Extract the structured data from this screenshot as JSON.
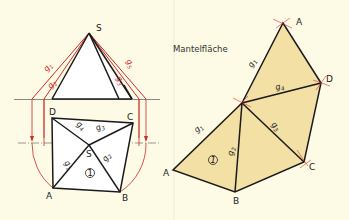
{
  "title": "Mantelfläche",
  "colors": {
    "background": "#fdfbe6",
    "fill_development": "#f3e0a5",
    "fill_plan": "#ffffff",
    "construction_red": "#cc2a2a",
    "line_black": "#1a1a1a",
    "separator": "#e8e4cc"
  },
  "elevation": {
    "apex_label": "S",
    "edge_labels": [
      "g1",
      "g2",
      "g3",
      "g5"
    ]
  },
  "plan_view": {
    "vertices": [
      "A",
      "B",
      "C",
      "D",
      "S"
    ],
    "edge_labels": [
      "g1",
      "g2",
      "g3",
      "g4"
    ],
    "face_number": "1"
  },
  "development": {
    "vertices": [
      "A",
      "D",
      "C",
      "A",
      "B"
    ],
    "edge_labels": [
      "g1",
      "g4",
      "g3",
      "g1",
      "g2"
    ],
    "face_number": "1"
  },
  "labels": {
    "S": "S",
    "A": "A",
    "B": "B",
    "C": "C",
    "D": "D",
    "g1": "g",
    "g2": "g",
    "g3": "g",
    "g4": "g",
    "g5": "g",
    "sub1": "1",
    "sub2": "2",
    "sub3": "3",
    "sub4": "4",
    "sub5": "5",
    "face1": "1"
  }
}
